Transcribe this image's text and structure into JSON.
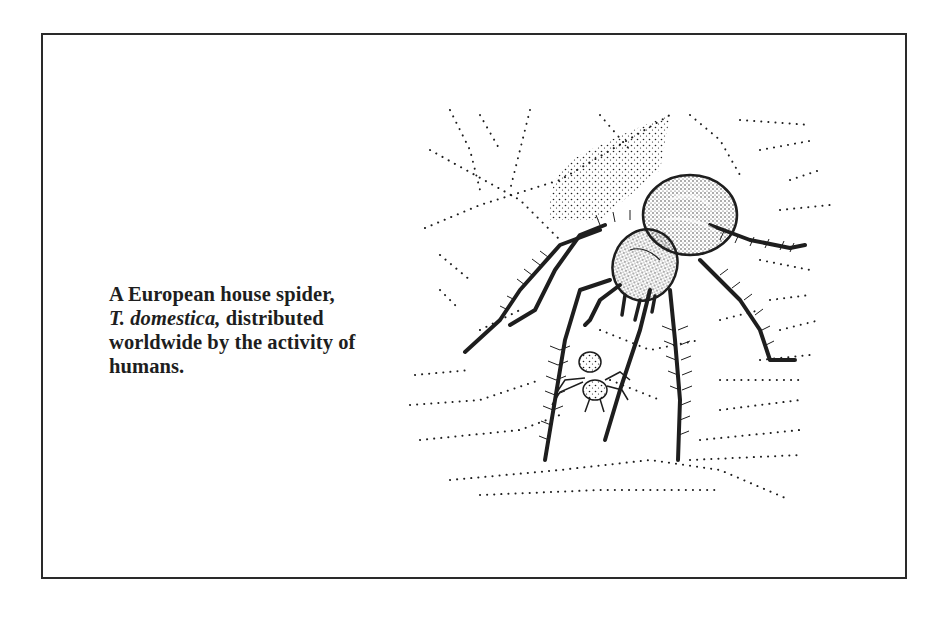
{
  "figure": {
    "caption": {
      "line1": "A European house spider,",
      "line2_italic": "T. domestica,",
      "line2_rest": " distributed",
      "line3": "worldwide by the activity of",
      "line4": "humans."
    },
    "illustration": {
      "subject": "spider-on-web-illustration",
      "description": "Pen-and-ink stipple drawing of a large house spider on a dotted sheet web with a small spiderling below"
    },
    "colors": {
      "ink": "#1e1e1e",
      "border": "#2a2a2a",
      "background": "#ffffff"
    }
  }
}
